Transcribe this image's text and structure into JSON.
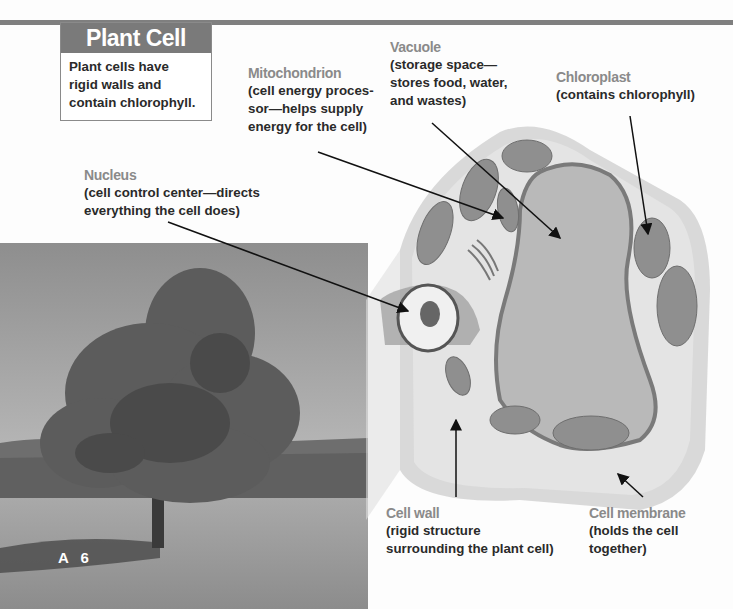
{
  "title": {
    "heading": "Plant Cell",
    "description_lines": [
      "Plant cells have",
      "rigid walls and",
      "contain chlorophyll."
    ]
  },
  "labels": {
    "mitochondrion": {
      "name": "Mitochondrion",
      "lines": [
        "(cell energy proces-",
        "sor—helps supply",
        "energy for the cell)"
      ]
    },
    "vacuole": {
      "name": "Vacuole",
      "lines": [
        "(storage space—",
        "stores food, water,",
        "and wastes)"
      ]
    },
    "chloroplast": {
      "name": "Chloroplast",
      "lines": [
        "(contains chlorophyll)"
      ]
    },
    "nucleus": {
      "name": "Nucleus",
      "lines": [
        "(cell control center—directs",
        "everything the cell does)"
      ]
    },
    "cell_wall": {
      "name": "Cell wall",
      "lines": [
        "(rigid structure",
        "surrounding the plant cell)"
      ]
    },
    "cell_membrane": {
      "name": "Cell membrane",
      "lines": [
        "(holds the cell",
        "together)"
      ]
    }
  },
  "page": {
    "number": "A 6"
  },
  "photo": {
    "subject": "oak tree in meadow"
  }
}
